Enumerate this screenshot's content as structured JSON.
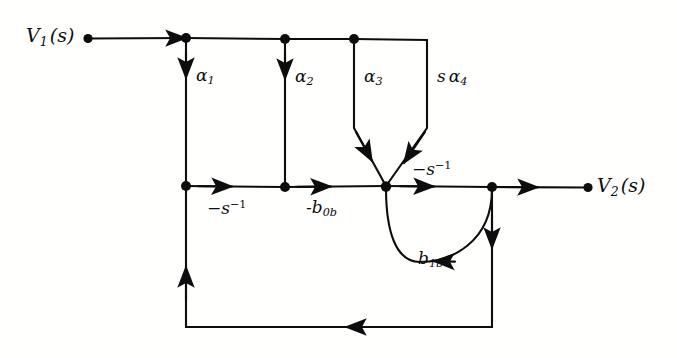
{
  "figure": {
    "type": "signal-flow-graph",
    "title": "",
    "stroke_color": "#0d0d0d",
    "background_color": "#ffffff"
  },
  "terminals": {
    "input": {
      "name": "V1(s)",
      "var": "V",
      "sub": "1",
      "arg": "(s)"
    },
    "output": {
      "name": "V2(s)",
      "var": "V",
      "sub": "2",
      "arg": "(s)"
    }
  },
  "branch_labels": {
    "alpha1": {
      "base": "α",
      "sub": "1"
    },
    "alpha2": {
      "base": "α",
      "sub": "2"
    },
    "alpha3": {
      "base": "α",
      "sub": "3"
    },
    "s_alpha4": {
      "prefix": "s",
      "base": "α",
      "sub": "4"
    },
    "neg_s_inv_left": {
      "base": "−s",
      "sup": "−1"
    },
    "neg_s_inv_right": {
      "base": "−s",
      "sup": "−1"
    },
    "neg_b0b": {
      "base": "-b",
      "sub": "0b"
    },
    "b1b": {
      "base": "b",
      "sub": "1b"
    }
  },
  "nodes": [
    {
      "id": "v1",
      "label": "V1(s)",
      "x": 88,
      "y": 38
    },
    {
      "id": "n1",
      "label": "",
      "x": 186,
      "y": 38
    },
    {
      "id": "n2",
      "label": "",
      "x": 285,
      "y": 38
    },
    {
      "id": "n3",
      "label": "",
      "x": 354,
      "y": 38
    },
    {
      "id": "m1",
      "label": "",
      "x": 186,
      "y": 186
    },
    {
      "id": "m2",
      "label": "",
      "x": 285,
      "y": 186
    },
    {
      "id": "j",
      "label": "",
      "x": 386,
      "y": 186
    },
    {
      "id": "m4",
      "label": "",
      "x": 492,
      "y": 186
    },
    {
      "id": "v2",
      "label": "V2(s)",
      "x": 588,
      "y": 186
    }
  ],
  "branches": [
    {
      "from": "v1",
      "to": "n1",
      "gain": "",
      "direction": "right"
    },
    {
      "from": "n1",
      "to": "m1",
      "gain": "α1",
      "direction": "down"
    },
    {
      "from": "n2",
      "to": "m2",
      "gain": "α2",
      "direction": "down"
    },
    {
      "from": "n3",
      "to": "j",
      "gain": "α3",
      "direction": "down"
    },
    {
      "from": "n3b",
      "to": "j",
      "gain": "sα4",
      "direction": "down"
    },
    {
      "from": "m1",
      "to": "m2",
      "gain": "−s−1",
      "direction": "right"
    },
    {
      "from": "m2",
      "to": "j",
      "gain": "-b0b",
      "direction": "right"
    },
    {
      "from": "j",
      "to": "m4",
      "gain": "−s−1",
      "direction": "right"
    },
    {
      "from": "m4",
      "to": "j",
      "gain": "b1b",
      "direction": "arc-left"
    },
    {
      "from": "m4",
      "to": "v2",
      "gain": "",
      "direction": "right"
    },
    {
      "from": "m4",
      "to": "m1",
      "gain": "",
      "direction": "feedback-loop"
    }
  ]
}
